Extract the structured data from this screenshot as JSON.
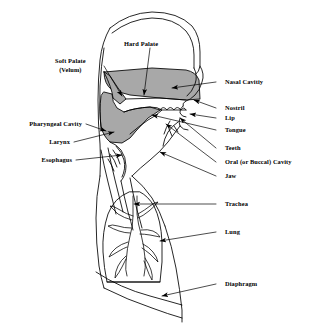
{
  "figure": {
    "background_color": "#ffffff",
    "line_color": "#000000",
    "shade_color": "#a8a8a8",
    "width": 310,
    "height": 329
  },
  "labels": {
    "hard_palate": "Hard Palate",
    "soft_palate": "Soft Palate",
    "velum": "(Velum)",
    "nasal_cavity": "Nasal Cavitiy",
    "nostril": "Nostril",
    "lip": "Lip",
    "tongue": "Tongue",
    "teeth": "Teeth",
    "oral_cavity": "Oral (or Buccal) Cavity",
    "jaw": "Jaw",
    "pharyngeal_cavity": "Pharyngeal Cavity",
    "larynx": "Larynx",
    "esophagus": "Esophagus",
    "trachea": "Trachea",
    "lung": "Lung",
    "diaphragm": "Diaphragm"
  },
  "structures": [
    "head-outline",
    "nasal-cavity-shaded",
    "soft-palate-shaded",
    "hard-palate",
    "pharyngeal-cavity-shaded",
    "tongue",
    "teeth",
    "lips",
    "jaw",
    "larynx",
    "esophagus",
    "trachea",
    "lung",
    "bronchial-tree",
    "diaphragm"
  ]
}
